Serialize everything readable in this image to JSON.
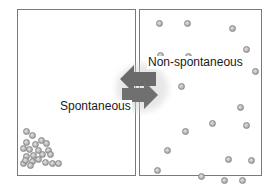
{
  "diagram": {
    "left_panel": {
      "description": "particles clustered in bottom-left corner",
      "particles": [
        [
          5,
          118
        ],
        [
          11,
          122
        ],
        [
          5,
          129
        ],
        [
          14,
          131
        ],
        [
          20,
          127
        ],
        [
          2,
          135
        ],
        [
          8,
          136
        ],
        [
          17,
          137
        ],
        [
          27,
          137
        ],
        [
          25,
          130
        ],
        [
          5,
          143
        ],
        [
          12,
          142
        ],
        [
          21,
          141
        ],
        [
          29,
          141
        ],
        [
          11,
          148
        ],
        [
          17,
          146
        ],
        [
          2,
          150
        ],
        [
          9,
          152
        ],
        [
          31,
          150
        ],
        [
          37,
          150
        ],
        [
          24,
          149
        ],
        [
          4,
          147
        ]
      ],
      "label": "Spontaneous"
    },
    "right_panel": {
      "description": "particles dispersed throughout container",
      "particles": [
        [
          16,
          10
        ],
        [
          44,
          10
        ],
        [
          89,
          15
        ],
        [
          103,
          36
        ],
        [
          17,
          42
        ],
        [
          45,
          43
        ],
        [
          112,
          58
        ],
        [
          38,
          73
        ],
        [
          97,
          94
        ],
        [
          103,
          112
        ],
        [
          69,
          110
        ],
        [
          42,
          118
        ],
        [
          24,
          137
        ],
        [
          85,
          146
        ],
        [
          108,
          147
        ],
        [
          14,
          157
        ],
        [
          58,
          163
        ],
        [
          81,
          167
        ],
        [
          99,
          167
        ]
      ],
      "label": "Non-spontaneous"
    },
    "arrows": {
      "top_arrow": "left-pointing (right to left)",
      "bottom_arrow": "right-pointing (left to right)",
      "color": "#6a6a6a"
    }
  }
}
